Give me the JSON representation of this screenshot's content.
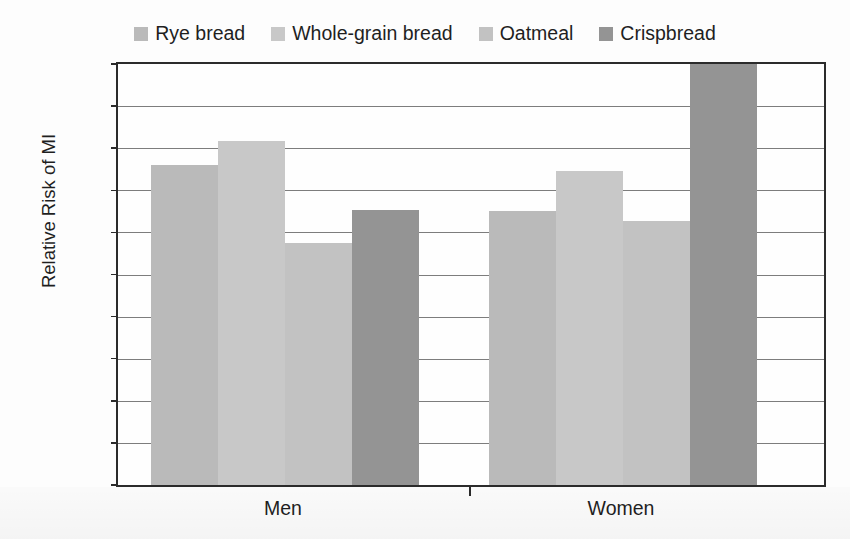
{
  "chart_data": {
    "type": "bar",
    "title": "",
    "xlabel": "",
    "ylabel": "Relative Risk of MI",
    "ylim": [
      0.6,
      1.1
    ],
    "yticks": [
      "0.6",
      "0.65",
      "0.7",
      "0.75",
      "0.8",
      "0.85",
      "0.9",
      "0.95",
      "1",
      "1.05",
      "1.1"
    ],
    "ytick_values": [
      0.6,
      0.65,
      0.7,
      0.75,
      0.8,
      0.85,
      0.9,
      0.95,
      1.0,
      1.05,
      1.1
    ],
    "grid": true,
    "legend_position": "top-center",
    "categories": [
      "Men",
      "Women"
    ],
    "series": [
      {
        "name": "Rye bread",
        "color": "#bababa",
        "values": [
          0.98,
          0.925
        ]
      },
      {
        "name": "Whole-grain bread",
        "color": "#c8c8c8",
        "values": [
          1.008,
          0.973
        ]
      },
      {
        "name": "Oatmeal",
        "color": "#c2c2c2",
        "values": [
          0.888,
          0.913
        ]
      },
      {
        "name": "Crispbread",
        "color": "#949494",
        "values": [
          0.927,
          1.1
        ]
      }
    ]
  },
  "legend": {
    "entries": [
      {
        "label": "Rye bread",
        "swatch": "#bababa"
      },
      {
        "label": "Whole-grain bread",
        "swatch": "#c8c8c8"
      },
      {
        "label": "Oatmeal",
        "swatch": "#c2c2c2"
      },
      {
        "label": "Crispbread",
        "swatch": "#949494"
      }
    ]
  },
  "axes": {
    "y_title": "Relative Risk of MI",
    "y_labels": [
      "1.1",
      "1.05",
      "1",
      "0.95",
      "0.9",
      "0.85",
      "0.8",
      "0.75",
      "0.7",
      "0.65",
      "0.6"
    ],
    "x_labels": [
      "Men",
      "Women"
    ]
  }
}
